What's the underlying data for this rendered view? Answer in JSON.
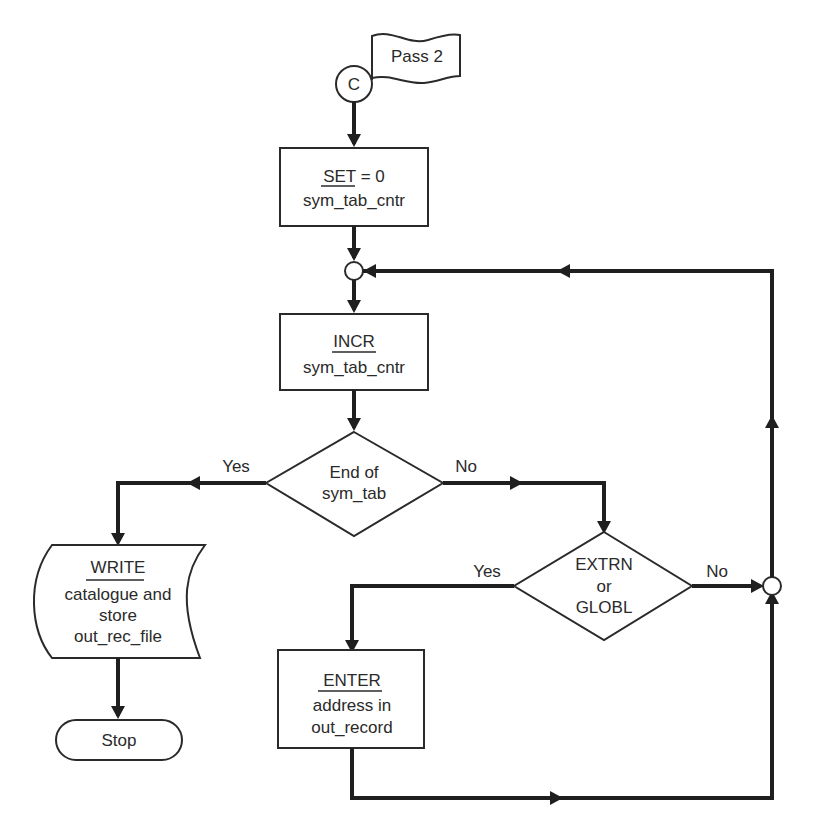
{
  "diagram": {
    "type": "flowchart",
    "connector_start": {
      "label": "C"
    },
    "flag": {
      "label": "Pass 2"
    },
    "nodes": {
      "set": {
        "keyword": "SET",
        "suffix": " = 0",
        "line2": "sym_tab_cntr"
      },
      "incr": {
        "keyword": "INCR",
        "line2": "sym_tab_cntr"
      },
      "decision_end": {
        "line1": "End of",
        "line2": "sym_tab"
      },
      "decision_extrn": {
        "line1": "EXTRN",
        "line2": "or",
        "line3": "GLOBL"
      },
      "write": {
        "keyword": "WRITE",
        "line2": "catalogue and",
        "line3": "store",
        "line4": "out_rec_file"
      },
      "enter": {
        "keyword": "ENTER",
        "line2": "address in",
        "line3": "out_record"
      },
      "stop": {
        "label": "Stop"
      }
    },
    "edge_labels": {
      "end_yes": "Yes",
      "end_no": "No",
      "extrn_yes": "Yes",
      "extrn_no": "No"
    },
    "colors": {
      "ink": "#1f1f1f",
      "background": "#ffffff"
    }
  }
}
